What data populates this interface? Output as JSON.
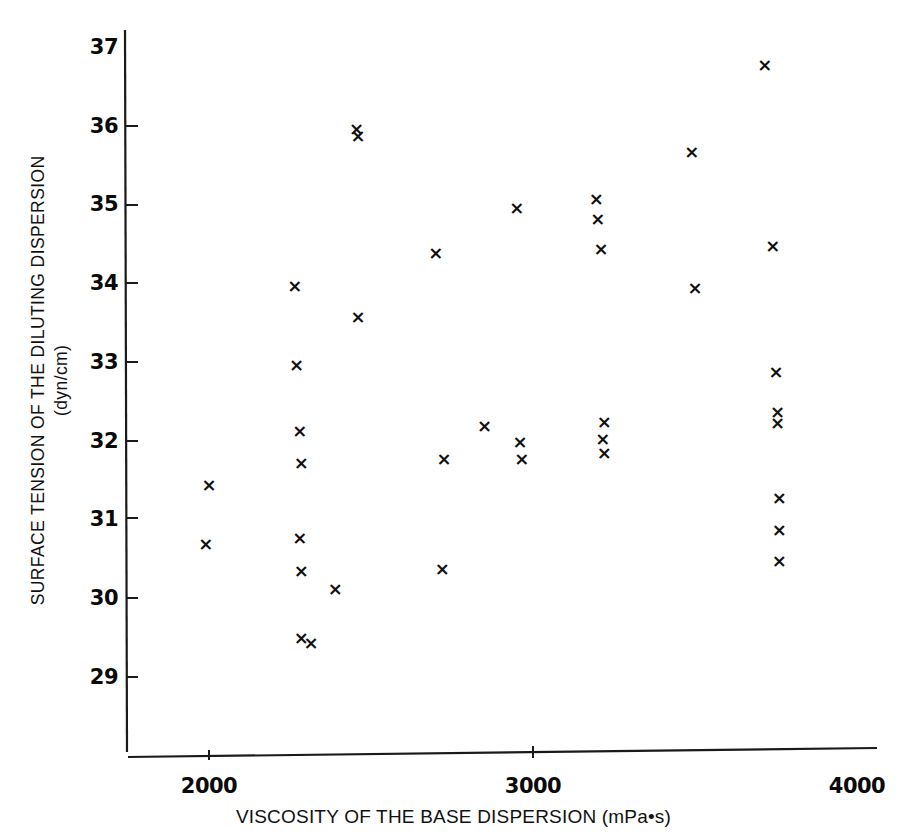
{
  "chart_data": {
    "type": "scatter",
    "title": "",
    "xlabel": "VISCOSITY OF THE BASE DISPERSION (mPa•s)",
    "ylabel_line1": "SURFACE TENSION OF THE DILUTING DISPERSION",
    "ylabel_line2": "(dyn/cm)",
    "xlim": [
      1750,
      4000
    ],
    "ylim": [
      28.45,
      37.2
    ],
    "xticks": [
      2000,
      3000,
      4000
    ],
    "xtick_labels": [
      "2000",
      "3000",
      "4000"
    ],
    "yticks": [
      29,
      30,
      31,
      32,
      33,
      34,
      35,
      36,
      37
    ],
    "ytick_labels": [
      "29",
      "30",
      "31",
      "32",
      "33",
      "34",
      "35",
      "36",
      "37"
    ],
    "grid": false,
    "legend": null,
    "marker": "x",
    "marker_color": "#101010",
    "points": [
      {
        "x": 2000,
        "y": 31.45
      },
      {
        "x": 1990,
        "y": 30.7
      },
      {
        "x": 2265,
        "y": 33.98
      },
      {
        "x": 2270,
        "y": 32.97
      },
      {
        "x": 2280,
        "y": 32.13
      },
      {
        "x": 2285,
        "y": 31.73
      },
      {
        "x": 2280,
        "y": 30.78
      },
      {
        "x": 2285,
        "y": 30.35
      },
      {
        "x": 2285,
        "y": 29.5
      },
      {
        "x": 2315,
        "y": 29.44
      },
      {
        "x": 2455,
        "y": 35.97
      },
      {
        "x": 2460,
        "y": 35.88
      },
      {
        "x": 2460,
        "y": 33.58
      },
      {
        "x": 2390,
        "y": 30.13
      },
      {
        "x": 2700,
        "y": 34.4
      },
      {
        "x": 2725,
        "y": 31.78
      },
      {
        "x": 2720,
        "y": 30.38
      },
      {
        "x": 2850,
        "y": 32.2
      },
      {
        "x": 2950,
        "y": 34.97
      },
      {
        "x": 2960,
        "y": 32.0
      },
      {
        "x": 2965,
        "y": 31.78
      },
      {
        "x": 3195,
        "y": 35.08
      },
      {
        "x": 3200,
        "y": 34.83
      },
      {
        "x": 3210,
        "y": 34.45
      },
      {
        "x": 3220,
        "y": 32.25
      },
      {
        "x": 3215,
        "y": 32.03
      },
      {
        "x": 3220,
        "y": 31.85
      },
      {
        "x": 3490,
        "y": 35.68
      },
      {
        "x": 3500,
        "y": 33.95
      },
      {
        "x": 3715,
        "y": 36.78
      },
      {
        "x": 3740,
        "y": 34.48
      },
      {
        "x": 3750,
        "y": 32.88
      },
      {
        "x": 3755,
        "y": 32.37
      },
      {
        "x": 3755,
        "y": 32.23
      },
      {
        "x": 3760,
        "y": 31.28
      },
      {
        "x": 3760,
        "y": 30.88
      },
      {
        "x": 3760,
        "y": 30.48
      }
    ]
  },
  "axes": {
    "y_axis_line": "vertical-axis",
    "x_axis_line": "horizontal-axis"
  }
}
